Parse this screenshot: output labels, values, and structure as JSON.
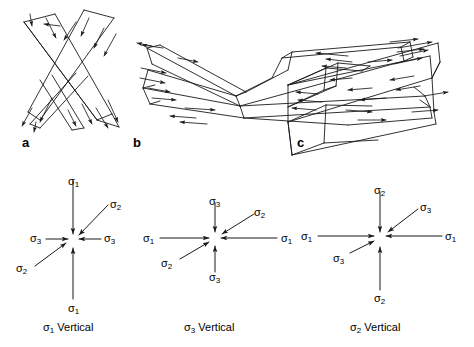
{
  "figure": {
    "width": 474,
    "height": 347,
    "background": "#ffffff",
    "line_color": "#1a1a1a",
    "type": "structural-geology-diagram"
  },
  "panels": [
    {
      "letter": "a",
      "letter_x": 22,
      "letter_y": 136,
      "fault_style": "steep conjugate X, strike-slip",
      "caption": "σ₁ Vertical",
      "caption_sigma": "σ",
      "caption_sub": "1",
      "caption_word": "Vertical",
      "caption_x": 75,
      "caption_y": 328
    },
    {
      "letter": "b",
      "letter_x": 133,
      "letter_y": 136,
      "fault_style": "shallow conjugate X, thrust",
      "caption": "σ₃ Vertical",
      "caption_sigma": "σ",
      "caption_sub": "3",
      "caption_word": "Vertical",
      "caption_x": 215,
      "caption_y": 328
    },
    {
      "letter": "c",
      "letter_x": 297,
      "letter_y": 136,
      "fault_style": "bowtie conjugate, normal",
      "caption": "σ₂ Vertical",
      "caption_sigma": "σ",
      "caption_sub": "2",
      "caption_word": "Vertical",
      "caption_x": 381,
      "caption_y": 328
    }
  ],
  "stress_diagrams": [
    {
      "id": "stress-a",
      "center": [
        73,
        240
      ],
      "vertical_axis": "σ₁",
      "horizontal_axis": "σ₃",
      "diagonal_axis": "σ₂",
      "labels": [
        {
          "name": "sigma1-top",
          "sigma": "σ",
          "sub": "1",
          "x": 68,
          "y": 176
        },
        {
          "name": "sigma1-bottom",
          "sigma": "σ",
          "sub": "1",
          "x": 68,
          "y": 303
        },
        {
          "name": "sigma3-left",
          "sigma": "σ",
          "sub": "3",
          "x": 30,
          "y": 233
        },
        {
          "name": "sigma3-right",
          "sigma": "σ",
          "sub": "3",
          "x": 100,
          "y": 233
        },
        {
          "name": "sigma2-upper-right",
          "sigma": "σ",
          "sub": "2",
          "x": 110,
          "y": 203
        },
        {
          "name": "sigma2-lower-left",
          "sigma": "σ",
          "sub": "2",
          "x": 16,
          "y": 265
        }
      ]
    },
    {
      "id": "stress-b",
      "center": [
        215,
        238
      ],
      "vertical_axis": "σ₃",
      "horizontal_axis": "σ₁",
      "diagonal_axis": "σ₂",
      "labels": [
        {
          "name": "sigma3-top",
          "sigma": "σ",
          "sub": "3",
          "x": 210,
          "y": 198
        },
        {
          "name": "sigma3-bottom",
          "sigma": "σ",
          "sub": "3",
          "x": 210,
          "y": 272
        },
        {
          "name": "sigma1-left",
          "sigma": "σ",
          "sub": "1",
          "x": 143,
          "y": 233
        },
        {
          "name": "sigma1-right",
          "sigma": "σ",
          "sub": "1",
          "x": 279,
          "y": 233
        },
        {
          "name": "sigma2-upper-right",
          "sigma": "σ",
          "sub": "2",
          "x": 256,
          "y": 212
        },
        {
          "name": "sigma2-lower-left",
          "sigma": "σ",
          "sub": "2",
          "x": 164,
          "y": 258
        }
      ]
    },
    {
      "id": "stress-c",
      "center": [
        380,
        238
      ],
      "vertical_axis": "σ₂",
      "horizontal_axis": "σ₁",
      "diagonal_axis": "σ₃",
      "labels": [
        {
          "name": "sigma2-top",
          "sigma": "σ",
          "sub": "2",
          "x": 375,
          "y": 187
        },
        {
          "name": "sigma2-bottom",
          "sigma": "σ",
          "sub": "2",
          "x": 375,
          "y": 295
        },
        {
          "name": "sigma1-left",
          "sigma": "σ",
          "sub": "1",
          "x": 303,
          "y": 233
        },
        {
          "name": "sigma1-right",
          "sigma": "σ",
          "sub": "1",
          "x": 444,
          "y": 233
        },
        {
          "name": "sigma3-upper-right",
          "sigma": "σ",
          "sub": "3",
          "x": 421,
          "y": 207
        },
        {
          "name": "sigma3-lower-left",
          "sigma": "σ",
          "sub": "3",
          "x": 334,
          "y": 255
        }
      ]
    }
  ]
}
